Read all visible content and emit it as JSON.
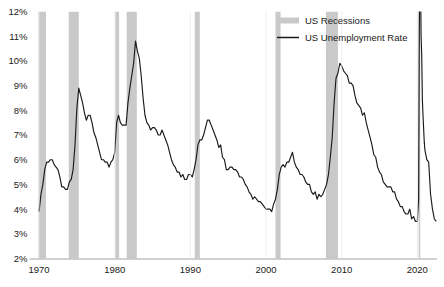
{
  "chart_data": {
    "type": "line",
    "title": "",
    "subtitle": "",
    "xlabel": "",
    "ylabel": "",
    "xlim": [
      1969.0,
      2022.6
    ],
    "ylim": [
      2,
      12
    ],
    "grid": false,
    "legend_position": "top-right",
    "y_tick_labels": [
      "2%",
      "3%",
      "4%",
      "5%",
      "6%",
      "7%",
      "8%",
      "9%",
      "10%",
      "11%",
      "12%"
    ],
    "y_tick_values": [
      2,
      3,
      4,
      5,
      6,
      7,
      8,
      9,
      10,
      11,
      12
    ],
    "x_tick_labels": [
      "1970",
      "1980",
      "1990",
      "2000",
      "2010",
      "2020"
    ],
    "x_tick_values": [
      1970,
      1980,
      1990,
      2000,
      2010,
      2020
    ],
    "legend": [
      {
        "name": "US Recessions",
        "marker": "swatch",
        "color": "#c9c9c9"
      },
      {
        "name": "US Unemployment Rate",
        "marker": "line",
        "color": "#1a1a1a"
      }
    ],
    "recession_bands": [
      {
        "label": "1969-1970 recession",
        "start": 1969.92,
        "end": 1970.92
      },
      {
        "label": "1973-1975 recession",
        "start": 1973.92,
        "end": 1975.25
      },
      {
        "label": "1980 recession",
        "start": 1980.08,
        "end": 1980.58
      },
      {
        "label": "1981-1982 recession",
        "start": 1981.58,
        "end": 1982.92
      },
      {
        "label": "1990-1991 recession",
        "start": 1990.58,
        "end": 1991.25
      },
      {
        "label": "2001 recession",
        "start": 2001.25,
        "end": 2001.92
      },
      {
        "label": "2007-2009 Great Recession",
        "start": 2007.92,
        "end": 2009.5
      },
      {
        "label": "2020 COVID-19 recession",
        "start": 2020.17,
        "end": 2020.33
      }
    ],
    "series": [
      {
        "name": "US Unemployment Rate",
        "color": "#1a1a1a",
        "unit": "percent",
        "clipped_above": 12,
        "note": "2020 COVID spike exceeds the 12% axis maximum and is clipped at the top of the plot",
        "x": [
          1970.0,
          1970.25,
          1970.5,
          1970.75,
          1971.0,
          1971.25,
          1971.5,
          1971.75,
          1972.0,
          1972.25,
          1972.5,
          1972.75,
          1973.0,
          1973.25,
          1973.5,
          1973.75,
          1974.0,
          1974.25,
          1974.5,
          1974.75,
          1975.0,
          1975.25,
          1975.5,
          1975.75,
          1976.0,
          1976.25,
          1976.5,
          1976.75,
          1977.0,
          1977.25,
          1977.5,
          1977.75,
          1978.0,
          1978.25,
          1978.5,
          1978.75,
          1979.0,
          1979.25,
          1979.5,
          1979.75,
          1980.0,
          1980.25,
          1980.5,
          1980.75,
          1981.0,
          1981.25,
          1981.5,
          1981.75,
          1982.0,
          1982.25,
          1982.5,
          1982.75,
          1983.0,
          1983.25,
          1983.5,
          1983.75,
          1984.0,
          1984.25,
          1984.5,
          1984.75,
          1985.0,
          1985.25,
          1985.5,
          1985.75,
          1986.0,
          1986.25,
          1986.5,
          1986.75,
          1987.0,
          1987.25,
          1987.5,
          1987.75,
          1988.0,
          1988.25,
          1988.5,
          1988.75,
          1989.0,
          1989.25,
          1989.5,
          1989.75,
          1990.0,
          1990.25,
          1990.5,
          1990.75,
          1991.0,
          1991.25,
          1991.5,
          1991.75,
          1992.0,
          1992.25,
          1992.5,
          1992.75,
          1993.0,
          1993.25,
          1993.5,
          1993.75,
          1994.0,
          1994.25,
          1994.5,
          1994.75,
          1995.0,
          1995.25,
          1995.5,
          1995.75,
          1996.0,
          1996.25,
          1996.5,
          1996.75,
          1997.0,
          1997.25,
          1997.5,
          1997.75,
          1998.0,
          1998.25,
          1998.5,
          1998.75,
          1999.0,
          1999.25,
          1999.5,
          1999.75,
          2000.0,
          2000.25,
          2000.5,
          2000.75,
          2001.0,
          2001.25,
          2001.5,
          2001.75,
          2002.0,
          2002.25,
          2002.5,
          2002.75,
          2003.0,
          2003.25,
          2003.5,
          2003.75,
          2004.0,
          2004.25,
          2004.5,
          2004.75,
          2005.0,
          2005.25,
          2005.5,
          2005.75,
          2006.0,
          2006.25,
          2006.5,
          2006.75,
          2007.0,
          2007.25,
          2007.5,
          2007.75,
          2008.0,
          2008.25,
          2008.5,
          2008.75,
          2009.0,
          2009.25,
          2009.5,
          2009.75,
          2010.0,
          2010.25,
          2010.5,
          2010.75,
          2011.0,
          2011.25,
          2011.5,
          2011.75,
          2012.0,
          2012.25,
          2012.5,
          2012.75,
          2013.0,
          2013.25,
          2013.5,
          2013.75,
          2014.0,
          2014.25,
          2014.5,
          2014.75,
          2015.0,
          2015.25,
          2015.5,
          2015.75,
          2016.0,
          2016.25,
          2016.5,
          2016.75,
          2017.0,
          2017.25,
          2017.5,
          2017.75,
          2018.0,
          2018.25,
          2018.5,
          2018.75,
          2019.0,
          2019.25,
          2019.5,
          2019.75,
          2020.0,
          2020.17,
          2020.25,
          2020.33,
          2020.42,
          2020.5,
          2020.58,
          2020.67,
          2020.75,
          2020.92,
          2021.0,
          2021.25,
          2021.5,
          2021.75,
          2022.0,
          2022.25,
          2022.5
        ],
        "y": [
          3.9,
          4.6,
          5.0,
          5.6,
          5.9,
          5.9,
          6.0,
          6.0,
          5.8,
          5.7,
          5.6,
          5.3,
          4.9,
          4.9,
          4.8,
          4.8,
          5.1,
          5.2,
          5.6,
          6.6,
          8.1,
          8.9,
          8.6,
          8.3,
          7.9,
          7.6,
          7.8,
          7.8,
          7.5,
          7.1,
          6.9,
          6.6,
          6.3,
          6.0,
          6.0,
          5.9,
          5.9,
          5.7,
          5.9,
          6.0,
          6.3,
          7.5,
          7.8,
          7.5,
          7.4,
          7.4,
          7.4,
          8.3,
          8.9,
          9.4,
          9.9,
          10.8,
          10.4,
          10.1,
          9.4,
          8.5,
          7.8,
          7.5,
          7.4,
          7.2,
          7.3,
          7.3,
          7.2,
          7.0,
          7.0,
          7.2,
          7.0,
          6.8,
          6.6,
          6.3,
          6.0,
          5.8,
          5.7,
          5.5,
          5.5,
          5.3,
          5.4,
          5.2,
          5.2,
          5.4,
          5.4,
          5.3,
          5.6,
          6.0,
          6.6,
          6.8,
          6.8,
          7.0,
          7.3,
          7.6,
          7.6,
          7.4,
          7.2,
          7.0,
          6.8,
          6.5,
          6.6,
          6.1,
          6.0,
          5.6,
          5.6,
          5.7,
          5.7,
          5.6,
          5.6,
          5.5,
          5.3,
          5.3,
          5.2,
          5.0,
          4.9,
          4.7,
          4.6,
          4.4,
          4.5,
          4.4,
          4.3,
          4.3,
          4.2,
          4.1,
          4.0,
          4.0,
          4.0,
          3.9,
          4.2,
          4.4,
          4.8,
          5.4,
          5.7,
          5.8,
          5.7,
          5.9,
          5.9,
          6.1,
          6.3,
          5.9,
          5.7,
          5.6,
          5.4,
          5.4,
          5.3,
          5.1,
          5.0,
          5.0,
          4.7,
          4.6,
          4.7,
          4.4,
          4.6,
          4.5,
          4.6,
          4.8,
          5.0,
          5.4,
          6.1,
          6.9,
          8.3,
          9.3,
          9.5,
          9.9,
          9.8,
          9.6,
          9.5,
          9.4,
          9.1,
          9.1,
          9.0,
          8.6,
          8.3,
          8.2,
          8.1,
          7.8,
          7.9,
          7.5,
          7.2,
          6.9,
          6.6,
          6.2,
          6.1,
          5.7,
          5.5,
          5.4,
          5.1,
          5.0,
          4.9,
          4.9,
          4.9,
          4.7,
          4.7,
          4.4,
          4.3,
          4.1,
          4.1,
          3.9,
          3.8,
          3.8,
          4.0,
          3.6,
          3.7,
          3.5,
          3.5,
          4.4,
          10.5,
          14.7,
          13.2,
          11.0,
          10.2,
          8.4,
          7.8,
          6.7,
          6.4,
          6.0,
          5.9,
          4.6,
          4.0,
          3.6,
          3.5
        ]
      }
    ]
  }
}
